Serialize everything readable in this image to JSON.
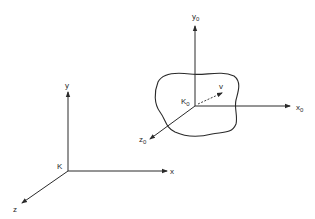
{
  "diagram": {
    "colors": {
      "ink": "#2a2a2a",
      "background": "#ffffff"
    },
    "frame_k": {
      "origin_label": "K",
      "x_label": "x",
      "y_label": "y",
      "z_label": "z"
    },
    "frame_k0": {
      "origin_label": "K",
      "origin_sub": "0",
      "x_label": "x",
      "x_sub": "0",
      "y_label": "y",
      "y_sub": "0",
      "z_label": "z",
      "z_sub": "0"
    },
    "velocity_label": "v"
  }
}
